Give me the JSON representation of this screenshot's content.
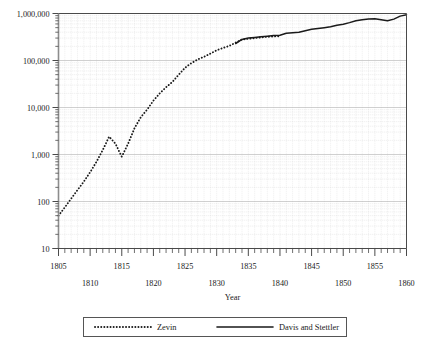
{
  "chart_data": {
    "type": "line",
    "title": "",
    "xlabel": "Year",
    "ylabel": "",
    "yscale": "log",
    "ylim": [
      10,
      1000000
    ],
    "xlim": [
      1805,
      1860
    ],
    "grid": true,
    "grid_minor": true,
    "legend_position": "below",
    "y_ticks": [
      {
        "value": 10,
        "label": "10"
      },
      {
        "value": 100,
        "label": "100"
      },
      {
        "value": 1000,
        "label": "1,000"
      },
      {
        "value": 10000,
        "label": "10,000"
      },
      {
        "value": 100000,
        "label": "100,000"
      },
      {
        "value": 1000000,
        "label": "1,000,000"
      }
    ],
    "x_ticks_upper": [
      {
        "value": 1805,
        "label": "1805"
      },
      {
        "value": 1815,
        "label": "1815"
      },
      {
        "value": 1825,
        "label": "1825"
      },
      {
        "value": 1835,
        "label": "1835"
      },
      {
        "value": 1845,
        "label": "1845"
      },
      {
        "value": 1855,
        "label": "1855"
      }
    ],
    "x_ticks_lower": [
      {
        "value": 1810,
        "label": "1810"
      },
      {
        "value": 1820,
        "label": "1820"
      },
      {
        "value": 1830,
        "label": "1830"
      },
      {
        "value": 1840,
        "label": "1840"
      },
      {
        "value": 1850,
        "label": "1850"
      },
      {
        "value": 1860,
        "label": "1860"
      }
    ],
    "x_tick_interval_minor": 1,
    "x_tick_interval_major": 5,
    "series": [
      {
        "name": "Zevin",
        "style": "dotted",
        "color": "#1a1a1a",
        "x": [
          1805,
          1806,
          1807,
          1808,
          1809,
          1810,
          1811,
          1812,
          1813,
          1814,
          1815,
          1816,
          1817,
          1818,
          1819,
          1820,
          1821,
          1822,
          1823,
          1824,
          1825,
          1826,
          1827,
          1828,
          1829,
          1830,
          1831,
          1832,
          1833,
          1834,
          1835,
          1836,
          1837,
          1838,
          1839,
          1840
        ],
        "values": [
          50,
          75,
          115,
          175,
          265,
          420,
          700,
          1250,
          2400,
          1700,
          900,
          1700,
          3600,
          6200,
          9000,
          14000,
          20000,
          27000,
          35000,
          50000,
          70000,
          88000,
          105000,
          120000,
          140000,
          165000,
          185000,
          205000,
          240000,
          280000,
          290000,
          300000,
          310000,
          320000,
          325000,
          330000
        ]
      },
      {
        "name": "Davis and Stettler",
        "style": "solid",
        "color": "#1a1a1a",
        "x": [
          1833,
          1834,
          1835,
          1836,
          1837,
          1838,
          1839,
          1840,
          1841,
          1842,
          1843,
          1844,
          1845,
          1846,
          1847,
          1848,
          1849,
          1850,
          1851,
          1852,
          1853,
          1854,
          1855,
          1856,
          1857,
          1858,
          1859,
          1860
        ],
        "values": [
          230000,
          280000,
          300000,
          310000,
          320000,
          330000,
          340000,
          345000,
          380000,
          390000,
          400000,
          430000,
          460000,
          480000,
          500000,
          520000,
          560000,
          590000,
          640000,
          700000,
          740000,
          760000,
          770000,
          740000,
          700000,
          760000,
          880000,
          940000
        ]
      }
    ]
  },
  "legend": {
    "entries": [
      {
        "label": "Zevin",
        "style": "dotted"
      },
      {
        "label": "Davis and Stettler",
        "style": "solid"
      }
    ]
  },
  "axis_titles": {
    "x": "Year"
  }
}
